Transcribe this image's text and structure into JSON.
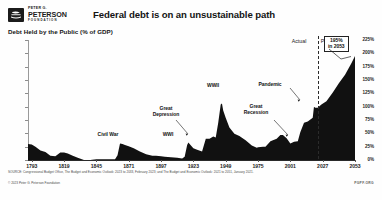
{
  "header": {
    "logo": {
      "line1": "PETER G.",
      "line2": "PETERSON",
      "line3": "FOUNDATION",
      "icon": "peterson-foundation-logo"
    },
    "title": "Federal debt is on an unsustainable path"
  },
  "subtitle": "Debt Held by the Public (% of GDP)",
  "labels": {
    "actual": "Actual",
    "projected": "Projected"
  },
  "badge": {
    "value": "195%",
    "year": "in 2053"
  },
  "footer": {
    "source": "SOURCE: Congressional Budget Office, The Budget and Economic Outlook: 2023 to 2033, February 2023; and The Budget and Economic Outlook: 2021 to 2051, January 2021.",
    "copyright": "© 2023 Peter G. Peterson Foundation",
    "org": "PGPF.ORG"
  },
  "chart_data": {
    "type": "area",
    "title": "Federal debt is on an unsustainable path",
    "subtitle": "Debt Held by the Public (% of GDP)",
    "xlabel": "",
    "ylabel": "Debt Held by the Public (% of GDP)",
    "xlim": [
      1790,
      2053
    ],
    "ylim": [
      0,
      225
    ],
    "grid": false,
    "legend": false,
    "fill_color": "#111111",
    "divider_year": 2023,
    "y_ticks": [
      "0%",
      "25%",
      "50%",
      "75%",
      "100%",
      "125%",
      "150%",
      "175%",
      "200%",
      "225%"
    ],
    "y_tick_values": [
      0,
      25,
      50,
      75,
      100,
      125,
      150,
      175,
      200,
      225
    ],
    "x_ticks": [
      1793,
      1819,
      1845,
      1871,
      1897,
      1923,
      1949,
      1975,
      2001,
      2027,
      2053
    ],
    "annotations": [
      {
        "label": "Civil War",
        "year": 1864,
        "value": 31,
        "arrow": false
      },
      {
        "label": "WWI",
        "year": 1919,
        "value": 33,
        "arrow": false
      },
      {
        "label": "Great\nDepression",
        "year": 1933,
        "value": 40,
        "arrow": true
      },
      {
        "label": "WWII",
        "year": 1946,
        "value": 106,
        "arrow": false
      },
      {
        "label": "Great\nRecession",
        "year": 2009,
        "value": 52,
        "arrow": true
      },
      {
        "label": "Pandemic",
        "year": 2020,
        "value": 100,
        "arrow": true
      }
    ],
    "x": [
      1790,
      1793,
      1796,
      1800,
      1804,
      1808,
      1812,
      1816,
      1819,
      1822,
      1826,
      1830,
      1835,
      1836,
      1840,
      1845,
      1850,
      1855,
      1860,
      1862,
      1864,
      1866,
      1868,
      1871,
      1875,
      1880,
      1885,
      1890,
      1893,
      1897,
      1900,
      1905,
      1910,
      1914,
      1916,
      1918,
      1919,
      1920,
      1923,
      1926,
      1930,
      1933,
      1936,
      1939,
      1941,
      1943,
      1945,
      1946,
      1947,
      1949,
      1952,
      1956,
      1960,
      1965,
      1970,
      1974,
      1975,
      1979,
      1981,
      1985,
      1990,
      1993,
      1995,
      1998,
      2001,
      2004,
      2007,
      2009,
      2012,
      2015,
      2019,
      2020,
      2021,
      2023,
      2026,
      2030,
      2035,
      2040,
      2045,
      2050,
      2053
    ],
    "y": [
      30,
      29,
      25,
      18,
      15,
      8,
      7,
      14,
      14,
      12,
      8,
      4,
      0.2,
      0.1,
      0.2,
      1.3,
      1.6,
      1.3,
      1.4,
      9,
      31,
      30,
      28,
      26,
      22,
      16,
      11,
      8,
      8,
      7,
      6,
      5,
      4,
      3,
      6,
      28,
      33,
      30,
      22,
      19,
      16,
      40,
      40,
      44,
      42,
      70,
      104,
      106,
      93,
      79,
      61,
      49,
      45,
      37,
      27,
      23,
      24,
      25,
      25,
      35,
      40,
      47,
      47,
      41,
      31,
      34,
      35,
      52,
      70,
      72,
      79,
      100,
      98,
      98,
      104,
      110,
      126,
      144,
      160,
      181,
      195
    ]
  }
}
